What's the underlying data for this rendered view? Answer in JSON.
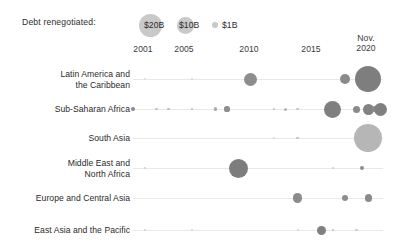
{
  "legend": {
    "title": "Debt renegotiated:",
    "items": [
      {
        "label": "$20B",
        "value": 20,
        "radius": 11.5,
        "cx": 150,
        "label_x": 144
      },
      {
        "label": "$10B",
        "value": 10,
        "radius": 8.5,
        "cx": 185,
        "label_x": 179
      },
      {
        "label": "$1B",
        "value": 1,
        "radius": 2.8,
        "cx": 215,
        "label_x": 222
      }
    ],
    "color": "#c9c9c9"
  },
  "axis": {
    "ticks": [
      {
        "label": "2001",
        "line1": "2001",
        "line2": "",
        "x": 143
      },
      {
        "label": "2005",
        "line1": "2005",
        "line2": "",
        "x": 184
      },
      {
        "label": "2010",
        "line1": "2010",
        "line2": "",
        "x": 249
      },
      {
        "label": "2015",
        "line1": "2015",
        "line2": "",
        "x": 311
      },
      {
        "label": "Nov. 2020",
        "line1": "Nov.",
        "line2": "2020",
        "x": 366
      }
    ],
    "x_min": 2000,
    "x_max": 2021,
    "px_min": 133,
    "px_max": 380
  },
  "rows": [
    {
      "label_line1": "Latin America and",
      "label_line2": "the Caribbean",
      "y": 79
    },
    {
      "label_line1": "Sub-Saharan Africa",
      "label_line2": "",
      "y": 109
    },
    {
      "label_line1": "South Asia",
      "label_line2": "",
      "y": 138
    },
    {
      "label_line1": "Middle East and",
      "label_line2": "North Africa",
      "y": 168
    },
    {
      "label_line1": "Europe and Central Asia",
      "label_line2": "",
      "y": 198
    },
    {
      "label_line1": "East Asia and the Pacific",
      "label_line2": "",
      "y": 230
    }
  ],
  "chart_data": {
    "type": "scatter",
    "xlabel": "",
    "ylabel": "",
    "xlim": [
      2000,
      2021
    ],
    "grid": false,
    "legend_position": "top-left",
    "size_legend_label": "Debt renegotiated:",
    "size_legend_values": [
      20,
      10,
      1
    ],
    "size_legend_unit": "billion USD",
    "series": [
      {
        "name": "Latin America and the Caribbean",
        "points": [
          {
            "x": 2001,
            "r": 1.0,
            "value": 0.5,
            "color": "#dedede"
          },
          {
            "x": 2005,
            "r": 1.2,
            "value": 0.6,
            "color": "#d8d8d8"
          },
          {
            "x": 2010,
            "r": 6.5,
            "value": 7.0,
            "color": "#8d8d8d"
          },
          {
            "x": 2018,
            "r": 5.0,
            "value": 4.2,
            "color": "#8a8a8a"
          },
          {
            "x": 2020,
            "r": 13.0,
            "value": 24.0,
            "color": "#7e7e7e"
          }
        ]
      },
      {
        "name": "Sub-Saharan Africa",
        "points": [
          {
            "x": 2000,
            "r": 2.2,
            "value": 0.9,
            "color": "#8a8a8a"
          },
          {
            "x": 2002,
            "r": 1.2,
            "value": 0.4,
            "color": "#c2c2c2"
          },
          {
            "x": 2003,
            "r": 1.3,
            "value": 0.5,
            "color": "#bdbdbd"
          },
          {
            "x": 2005,
            "r": 1.3,
            "value": 0.5,
            "color": "#bdbdbd"
          },
          {
            "x": 2007,
            "r": 1.8,
            "value": 0.7,
            "color": "#a8a8a8"
          },
          {
            "x": 2008,
            "r": 2.6,
            "value": 1.3,
            "color": "#8f8f8f"
          },
          {
            "x": 2012,
            "r": 1.3,
            "value": 0.5,
            "color": "#c0c0c0"
          },
          {
            "x": 2013,
            "r": 1.5,
            "value": 0.6,
            "color": "#b5b5b5"
          },
          {
            "x": 2014,
            "r": 1.2,
            "value": 0.4,
            "color": "#c5c5c5"
          },
          {
            "x": 2017,
            "r": 8.5,
            "value": 11.0,
            "color": "#7f7f7f"
          },
          {
            "x": 2019,
            "r": 3.5,
            "value": 2.2,
            "color": "#8a8a8a"
          },
          {
            "x": 2020,
            "r": 5.5,
            "value": 5.0,
            "color": "#828282"
          },
          {
            "x": 2020.6,
            "r": 3.2,
            "value": 1.9,
            "color": "#8a8a8a"
          },
          {
            "x": 2021,
            "r": 6.5,
            "value": 6.8,
            "color": "#808080"
          }
        ]
      },
      {
        "name": "South Asia",
        "points": [
          {
            "x": 2012,
            "r": 0.9,
            "value": 0.3,
            "color": "#d5d5d5"
          },
          {
            "x": 2014,
            "r": 1.4,
            "value": 0.5,
            "color": "#c0c0c0"
          },
          {
            "x": 2020,
            "r": 14.0,
            "value": 27.0,
            "color": "#b6b6b6"
          }
        ]
      },
      {
        "name": "Middle East and North Africa",
        "points": [
          {
            "x": 2001,
            "r": 1.1,
            "value": 0.3,
            "color": "#cfcfcf"
          },
          {
            "x": 2009,
            "r": 9.5,
            "value": 14.0,
            "color": "#7d7d7d"
          },
          {
            "x": 2017,
            "r": 1.2,
            "value": 0.4,
            "color": "#c8c8c8"
          },
          {
            "x": 2019.5,
            "r": 2.0,
            "value": 0.8,
            "color": "#8d8d8d"
          }
        ]
      },
      {
        "name": "Europe and Central Asia",
        "points": [
          {
            "x": 2014,
            "r": 4.8,
            "value": 4.0,
            "color": "#8b8b8b"
          },
          {
            "x": 2018,
            "r": 3.2,
            "value": 1.9,
            "color": "#8d8d8d"
          },
          {
            "x": 2020,
            "r": 3.6,
            "value": 2.3,
            "color": "#8a8a8a"
          }
        ]
      },
      {
        "name": "East Asia and the Pacific",
        "points": [
          {
            "x": 2001,
            "r": 1.1,
            "value": 0.3,
            "color": "#cfcfcf"
          },
          {
            "x": 2005,
            "r": 1.0,
            "value": 0.3,
            "color": "#d4d4d4"
          },
          {
            "x": 2014,
            "r": 1.0,
            "value": 0.3,
            "color": "#d2d2d2"
          },
          {
            "x": 2016,
            "r": 4.5,
            "value": 3.6,
            "color": "#808080"
          },
          {
            "x": 2017,
            "r": 1.2,
            "value": 0.4,
            "color": "#bfbfbf"
          },
          {
            "x": 2019,
            "r": 1.1,
            "value": 0.3,
            "color": "#cccccc"
          }
        ]
      }
    ]
  }
}
